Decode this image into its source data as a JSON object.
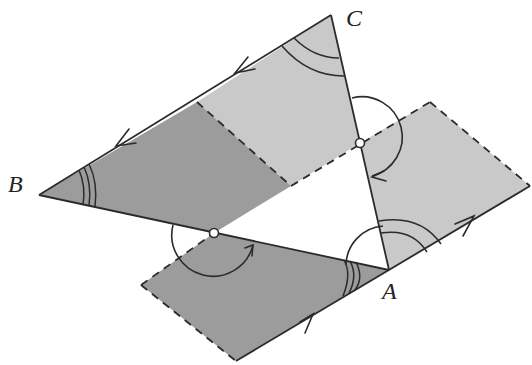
{
  "diagram": {
    "type": "geometric-construction",
    "vertices": {
      "A": {
        "label": "A",
        "x": 389,
        "y": 270
      },
      "B": {
        "label": "B",
        "x": 39,
        "y": 195
      },
      "C": {
        "label": "C",
        "x": 331,
        "y": 15
      }
    },
    "midpoints": [
      {
        "name": "midpoint-CA",
        "x": 360,
        "y": 143
      },
      {
        "name": "midpoint-BA",
        "x": 214,
        "y": 233
      }
    ],
    "colors": {
      "dark_region": "#9a9a9a",
      "light_region": "#c8c8c8",
      "stroke": "#2b2b2b",
      "background": "#ffffff"
    },
    "angle_marks": {
      "B": "triple arc",
      "C": "double arc",
      "A_rotated": "triple arc",
      "A_light": "double arc",
      "rotation_arcs": "half-circle arcs with arrows around midpoints"
    }
  }
}
